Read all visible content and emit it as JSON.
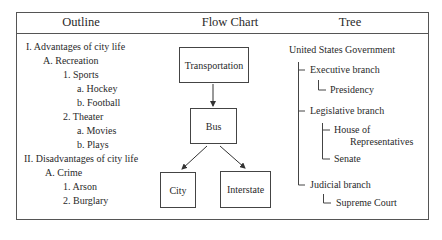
{
  "headers": {
    "outline": "Outline",
    "flow_chart": "Flow Chart",
    "tree": "Tree"
  },
  "outline": {
    "items": [
      "I.  Advantages of city life",
      "A. Recreation",
      "1. Sports",
      "a. Hockey",
      "b. Football",
      "2. Theater",
      "a. Movies",
      "b. Plays",
      "II.  Disadvantages of city life",
      "A. Crime",
      "1. Arson",
      "2. Burglary"
    ]
  },
  "flow_chart": {
    "nodes": {
      "transportation": "Transportation",
      "bus": "Bus",
      "city": "City",
      "interstate": "Interstate"
    },
    "edges": [
      [
        "Transportation",
        "Bus"
      ],
      [
        "Bus",
        "City"
      ],
      [
        "Bus",
        "Interstate"
      ]
    ]
  },
  "tree": {
    "root": "United States Government",
    "executive": "Executive branch",
    "presidency": "Presidency",
    "legislative": "Legislative branch",
    "house_line1": "House of",
    "house_line2": "Representatives",
    "senate": "Senate",
    "judicial": "Judicial branch",
    "supreme_court": "Supreme Court"
  }
}
